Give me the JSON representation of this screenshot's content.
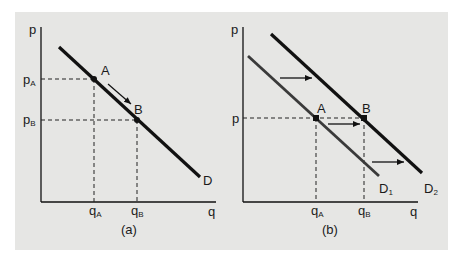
{
  "figure": {
    "background_color": "#e6e6e4",
    "line_color": "#111111",
    "d1_color": "#3a3a3a"
  },
  "panel_a": {
    "caption": "(a)",
    "y_axis_label": "p",
    "x_axis_label": "q",
    "price_labels": {
      "pA": "p",
      "pA_sub": "A",
      "pB": "p",
      "pB_sub": "B"
    },
    "quantity_labels": {
      "qA": "q",
      "qA_sub": "A",
      "qB": "q",
      "qB_sub": "B"
    },
    "points": [
      {
        "name": "A"
      },
      {
        "name": "B"
      }
    ],
    "curve_label": "D",
    "arrow": "movement along demand curve from A to B"
  },
  "panel_b": {
    "caption": "(b)",
    "y_axis_label": "p",
    "x_axis_label": "q",
    "price_label": "p",
    "quantity_labels": {
      "qA": "q",
      "qA_sub": "A",
      "qB": "q",
      "qB_sub": "B"
    },
    "points": [
      {
        "name": "A"
      },
      {
        "name": "B"
      }
    ],
    "curve_labels": {
      "d1": "D",
      "d1_sub": "1",
      "d2": "D",
      "d2_sub": "2"
    },
    "arrows": "rightward shift of demand from D1 to D2"
  }
}
